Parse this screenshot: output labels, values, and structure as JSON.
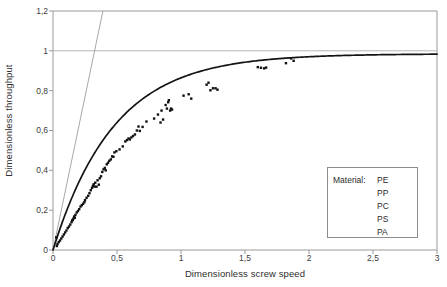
{
  "chart_data": {
    "type": "scatter",
    "title": "",
    "xlabel": "Dimensionless screw speed",
    "ylabel": "Dimensionless throughput",
    "xlim": [
      0,
      3
    ],
    "ylim": [
      0,
      1.2
    ],
    "xticks": [
      0,
      0.5,
      1,
      1.5,
      2,
      2.5,
      3
    ],
    "yticks": [
      0,
      0.2,
      0.4,
      0.6,
      0.8,
      1,
      1.2
    ],
    "xtick_labels": [
      "0",
      "0,5",
      "1",
      "1,5",
      "2",
      "2,5",
      "3"
    ],
    "ytick_labels": [
      "0",
      "0,2",
      "0,4",
      "0,6",
      "0,8",
      "1",
      "1,2"
    ],
    "grid": "horizontal-gridline-at-1",
    "gridlines_y": [
      1
    ],
    "legend_position": "inside-lower-right",
    "series": [
      {
        "name": "measured-data",
        "type": "scatter",
        "marker": "filled-square",
        "color": "#111111",
        "points": [
          [
            0.025,
            0.063
          ],
          [
            0.03,
            0.02
          ],
          [
            0.035,
            0.03
          ],
          [
            0.045,
            0.04
          ],
          [
            0.055,
            0.048
          ],
          [
            0.065,
            0.058
          ],
          [
            0.075,
            0.068
          ],
          [
            0.085,
            0.078
          ],
          [
            0.095,
            0.088
          ],
          [
            0.105,
            0.098
          ],
          [
            0.115,
            0.11
          ],
          [
            0.125,
            0.118
          ],
          [
            0.135,
            0.128
          ],
          [
            0.145,
            0.14
          ],
          [
            0.15,
            0.148
          ],
          [
            0.155,
            0.152
          ],
          [
            0.16,
            0.158
          ],
          [
            0.165,
            0.168
          ],
          [
            0.17,
            0.162
          ],
          [
            0.175,
            0.176
          ],
          [
            0.185,
            0.188
          ],
          [
            0.195,
            0.196
          ],
          [
            0.205,
            0.205
          ],
          [
            0.215,
            0.218
          ],
          [
            0.225,
            0.225
          ],
          [
            0.235,
            0.232
          ],
          [
            0.245,
            0.24
          ],
          [
            0.25,
            0.25
          ],
          [
            0.262,
            0.262
          ],
          [
            0.275,
            0.272
          ],
          [
            0.285,
            0.285
          ],
          [
            0.295,
            0.3
          ],
          [
            0.305,
            0.312
          ],
          [
            0.312,
            0.322
          ],
          [
            0.318,
            0.33
          ],
          [
            0.325,
            0.318
          ],
          [
            0.33,
            0.338
          ],
          [
            0.34,
            0.318
          ],
          [
            0.348,
            0.35
          ],
          [
            0.358,
            0.328
          ],
          [
            0.365,
            0.36
          ],
          [
            0.375,
            0.37
          ],
          [
            0.385,
            0.392
          ],
          [
            0.395,
            0.405
          ],
          [
            0.405,
            0.412
          ],
          [
            0.412,
            0.4
          ],
          [
            0.42,
            0.43
          ],
          [
            0.43,
            0.438
          ],
          [
            0.44,
            0.448
          ],
          [
            0.452,
            0.455
          ],
          [
            0.462,
            0.47
          ],
          [
            0.472,
            0.468
          ],
          [
            0.48,
            0.49
          ],
          [
            0.495,
            0.496
          ],
          [
            0.52,
            0.505
          ],
          [
            0.545,
            0.52
          ],
          [
            0.565,
            0.545
          ],
          [
            0.578,
            0.552
          ],
          [
            0.59,
            0.56
          ],
          [
            0.6,
            0.555
          ],
          [
            0.612,
            0.565
          ],
          [
            0.625,
            0.572
          ],
          [
            0.64,
            0.58
          ],
          [
            0.655,
            0.6
          ],
          [
            0.668,
            0.62
          ],
          [
            0.678,
            0.598
          ],
          [
            0.7,
            0.618
          ],
          [
            0.73,
            0.645
          ],
          [
            0.79,
            0.66
          ],
          [
            0.82,
            0.68
          ],
          [
            0.84,
            0.64
          ],
          [
            0.848,
            0.7
          ],
          [
            0.86,
            0.655
          ],
          [
            0.88,
            0.728
          ],
          [
            0.89,
            0.71
          ],
          [
            0.9,
            0.742
          ],
          [
            0.905,
            0.752
          ],
          [
            0.915,
            0.7
          ],
          [
            0.922,
            0.71
          ],
          [
            0.93,
            0.705
          ],
          [
            1.02,
            0.775
          ],
          [
            1.06,
            0.782
          ],
          [
            1.08,
            0.76
          ],
          [
            1.2,
            0.83
          ],
          [
            1.215,
            0.84
          ],
          [
            1.23,
            0.802
          ],
          [
            1.25,
            0.812
          ],
          [
            1.27,
            0.812
          ],
          [
            1.285,
            0.805
          ],
          [
            1.6,
            0.918
          ],
          [
            1.625,
            0.915
          ],
          [
            1.65,
            0.912
          ],
          [
            1.665,
            0.916
          ],
          [
            1.82,
            0.938
          ],
          [
            1.86,
            0.962
          ],
          [
            1.88,
            0.95
          ]
        ]
      },
      {
        "name": "fitted-curve",
        "type": "line",
        "color": "#141414",
        "model": "1-exp(-k*x), k≈2.1, plateau≈0.985"
      },
      {
        "name": "initial-tangent",
        "type": "line",
        "color": "#a8a8a8",
        "from": [
          0,
          0
        ],
        "to": [
          0.39,
          1.2
        ],
        "slope": 3.08
      }
    ],
    "legend": {
      "title": "Material:",
      "entries": [
        "PE",
        "PP",
        "PC",
        "PS",
        "PA"
      ]
    }
  },
  "axes": {
    "ylabel": "Dimensionless throughput",
    "xlabel": "Dimensionless screw speed",
    "ytick_labels": [
      "1,2",
      "1",
      "0,8",
      "0,6",
      "0,4",
      "0,2",
      "0"
    ],
    "xtick_labels": [
      "0",
      "0,5",
      "1",
      "1,5",
      "2",
      "2,5",
      "3"
    ]
  },
  "legend": {
    "title": "Material:",
    "items": [
      "PE",
      "PP",
      "PC",
      "PS",
      "PA"
    ]
  },
  "colors": {
    "curve": "#141414",
    "tangent": "#a8a8a8",
    "marker": "#111111",
    "frame": "#9a9a9a",
    "gridline": "#b5b5b5",
    "legend_border": "#8d8d8d",
    "text": "#2e2e2e"
  }
}
